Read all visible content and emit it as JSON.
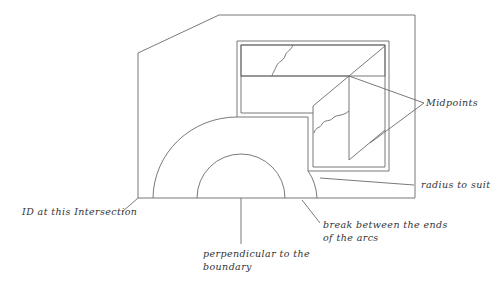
{
  "diagram": {
    "type": "technical-drawing",
    "line_color": "#6a6a6a",
    "text_color": "#333333",
    "labels": {
      "midpoints": "Midpoints",
      "radius": "radius to suit",
      "id_intersection": "ID at this Intersection",
      "break_line1": "break between the ends",
      "break_line2": "of the arcs",
      "perp_line1": "perpendicular to the",
      "perp_line2": "boundary"
    }
  }
}
